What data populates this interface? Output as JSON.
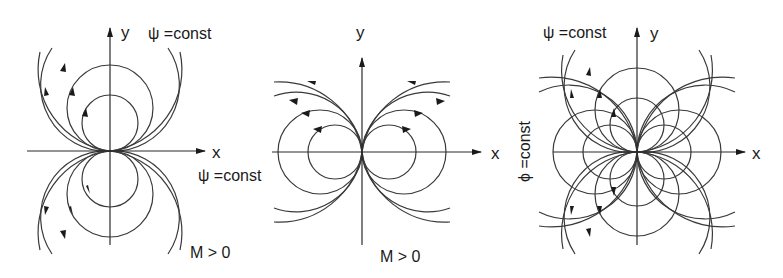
{
  "figure": {
    "panels": [
      {
        "id": "doublet-vertical",
        "labels": {
          "x_axis": "x",
          "y_axis": "y",
          "psi": "ψ =const",
          "condition": "M > 0"
        },
        "origin": [
          110,
          151
        ],
        "radii": [
          28,
          43,
          62,
          82
        ]
      },
      {
        "id": "doublet-horizontal",
        "labels": {
          "x_axis": "x",
          "y_axis": "y",
          "psi": "ψ =const",
          "condition": "M > 0"
        },
        "origin": [
          362,
          152
        ],
        "radii": [
          27,
          42,
          62,
          82
        ]
      },
      {
        "id": "doublet-combined",
        "labels": {
          "x_axis": "x",
          "y_axis": "y",
          "psi": "ψ =const",
          "phi": "ϕ =const"
        },
        "origin": [
          637,
          152
        ],
        "radii": [
          27,
          42,
          62,
          82
        ]
      }
    ]
  },
  "colors": {
    "line": "#3a3a3a",
    "text": "#1a1a1a",
    "background": "#ffffff"
  }
}
